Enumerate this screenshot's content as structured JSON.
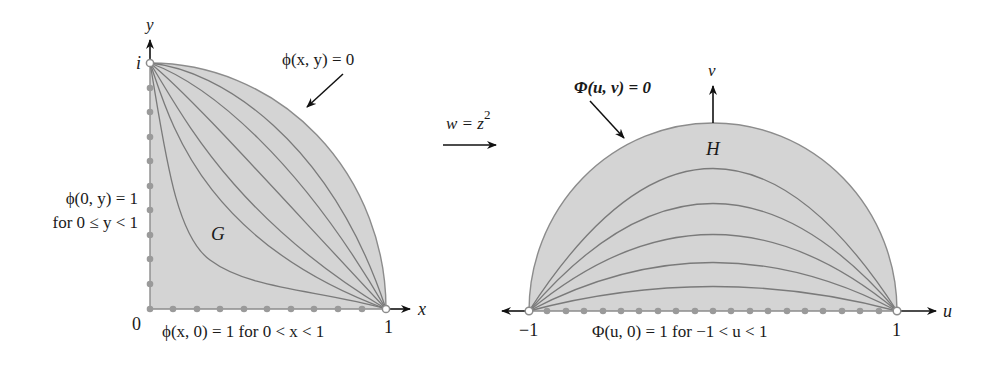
{
  "colors": {
    "region_fill": "#d4d4d4",
    "region_stroke": "#8c8c8c",
    "curve_stroke": "#7a7a7a",
    "dot_fill": "#9a9a9a",
    "axis_arrow": "#111111",
    "text": "#1a1a1a"
  },
  "left": {
    "axis_x_label": "x",
    "axis_y_label": "y",
    "origin_label": "0",
    "x_tick_label": "1",
    "y_tick_label": "i",
    "region_label": "G",
    "boundary_label": "ϕ(x, y) = 0",
    "left_condition_line1": "ϕ(0, y) = 1",
    "left_condition_line2": "for  0 ≤ y < 1",
    "bottom_condition": "ϕ(x, 0) = 1  for  0 < x < 1"
  },
  "mapping": {
    "label": "w = z",
    "exponent": "2"
  },
  "right": {
    "axis_u_label": "u",
    "axis_v_label": "v",
    "left_tick_label": "−1",
    "right_tick_label": "1",
    "region_label": "H",
    "boundary_label": "Φ(u, v) = 0",
    "bottom_condition": "Φ(u, 0) = 1   for  −1 < u < 1"
  }
}
